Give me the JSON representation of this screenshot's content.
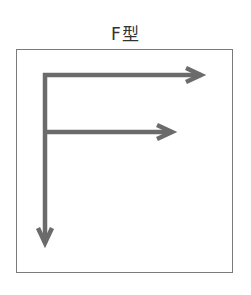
{
  "diagram": {
    "title": "F型",
    "stroke_color": "#6b6b6b",
    "frame_color": "#7a7a7a",
    "arrows": [
      {
        "name": "top-horizontal",
        "direction": "right",
        "from": [
          45,
          75
        ],
        "to": [
          203,
          75
        ]
      },
      {
        "name": "middle-horizontal",
        "direction": "right",
        "from": [
          45,
          132
        ],
        "to": [
          174,
          132
        ]
      },
      {
        "name": "vertical",
        "direction": "down",
        "from": [
          45,
          75
        ],
        "to": [
          45,
          245
        ]
      }
    ]
  }
}
